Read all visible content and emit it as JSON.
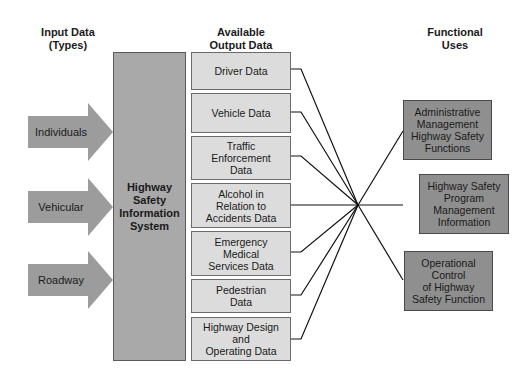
{
  "headers": {
    "input": "Input Data\n(Types)",
    "output": "Available\nOutput Data",
    "functional": "Functional\nUses"
  },
  "inputs": [
    {
      "label": "Individuals"
    },
    {
      "label": "Vehicular"
    },
    {
      "label": "Roadway"
    }
  ],
  "system": {
    "label": "Highway\nSafety\nInformation\nSystem"
  },
  "outputs": [
    {
      "label": "Driver Data"
    },
    {
      "label": "Vehicle Data"
    },
    {
      "label": "Traffic\nEnforcement\nData"
    },
    {
      "label": "Alcohol in\nRelation to\nAccidents Data"
    },
    {
      "label": "Emergency\nMedical\nServices Data"
    },
    {
      "label": "Pedestrian\nData"
    },
    {
      "label": "Highway Design\nand\nOperating Data"
    }
  ],
  "functional_uses": [
    {
      "label": "Administrative\nManagement\nHighway Safety\nFunctions"
    },
    {
      "label": "Highway Safety\nProgram\nManagement\nInformation"
    },
    {
      "label": "Operational\nControl\nof Highway\nSafety Function"
    }
  ],
  "colors": {
    "arrow": "#9c9c9c",
    "system": "#a9a9a9",
    "output_box": "#dcdcdc",
    "functional_box": "#8f8f8f"
  }
}
